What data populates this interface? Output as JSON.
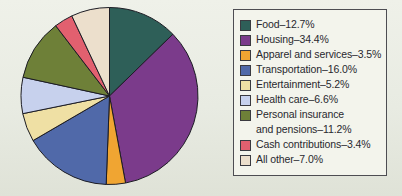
{
  "page": {
    "background_top": "#eff1e9",
    "background_bottom": "#dfe2d7"
  },
  "legend_box": {
    "background": "#f3f4ec",
    "border_color": "#4d4d52",
    "position": "right"
  },
  "chart_data": {
    "type": "pie",
    "title": "",
    "direction": "clockwise",
    "start_angle_deg_from_12": 0,
    "stroke_color": "#1c1c24",
    "legend_position": "right",
    "slices": [
      {
        "label": "Food",
        "value": 12.7,
        "color": "#2e5f58",
        "legend_label": "Food–12.7%"
      },
      {
        "label": "Housing",
        "value": 34.4,
        "color": "#7b3b8b",
        "legend_label": "Housing–34.4%"
      },
      {
        "label": "Apparel and services",
        "value": 3.5,
        "color": "#f0a532",
        "legend_label": "Apparel and services–3.5%"
      },
      {
        "label": "Transportation",
        "value": 16.0,
        "color": "#5069a9",
        "legend_label": "Transportation–16.0%"
      },
      {
        "label": "Entertainment",
        "value": 5.2,
        "color": "#efe0a4",
        "legend_label": "Entertainment–5.2%"
      },
      {
        "label": "Health care",
        "value": 6.6,
        "color": "#c7d1ed",
        "legend_label": "Health care–6.6%"
      },
      {
        "label": "Personal insurance and pensions",
        "value": 11.2,
        "color": "#6e8038",
        "legend_label": "Personal insurance\nand pensions–11.2%"
      },
      {
        "label": "Cash contributions",
        "value": 3.4,
        "color": "#e2606f",
        "legend_label": "Cash contributions–3.4%"
      },
      {
        "label": "All other",
        "value": 7.0,
        "color": "#ecdfcc",
        "legend_label": "All other–7.0%"
      }
    ]
  }
}
